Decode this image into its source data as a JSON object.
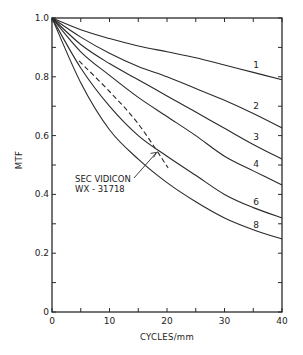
{
  "chart_data": {
    "type": "line",
    "title": "",
    "xlabel": "CYCLES/mm",
    "ylabel": "MTF",
    "xlim": [
      0,
      40
    ],
    "ylim": [
      0,
      1.0
    ],
    "grid": false,
    "x_ticks": [
      0,
      10,
      20,
      30,
      40
    ],
    "x_tick_labels": [
      "0",
      "10",
      "20",
      "30",
      "40"
    ],
    "x_minor_ticks": [
      5,
      15,
      25,
      35
    ],
    "y_ticks": [
      0,
      0.2,
      0.4,
      0.6,
      0.8,
      1.0
    ],
    "y_tick_labels": [
      "0",
      "0.2",
      "0.4",
      "0.6",
      "0.8",
      "1.0"
    ],
    "y_minor_ticks": [
      0.1,
      0.3,
      0.5,
      0.7,
      0.9
    ],
    "x": [
      0,
      5,
      10,
      15,
      20,
      25,
      30,
      35,
      40
    ],
    "series": [
      {
        "name": "1",
        "style": "solid",
        "values": [
          1.0,
          0.96,
          0.93,
          0.905,
          0.885,
          0.865,
          0.84,
          0.815,
          0.79
        ]
      },
      {
        "name": "2",
        "style": "solid",
        "values": [
          1.0,
          0.935,
          0.88,
          0.835,
          0.8,
          0.76,
          0.72,
          0.675,
          0.626
        ]
      },
      {
        "name": "3",
        "style": "solid",
        "values": [
          1.0,
          0.91,
          0.845,
          0.79,
          0.735,
          0.68,
          0.625,
          0.57,
          0.52
        ]
      },
      {
        "name": "4",
        "style": "solid",
        "values": [
          1.0,
          0.885,
          0.805,
          0.73,
          0.665,
          0.6,
          0.53,
          0.48,
          0.432
        ]
      },
      {
        "name": "6",
        "style": "solid",
        "values": [
          1.0,
          0.83,
          0.7,
          0.6,
          0.53,
          0.465,
          0.4,
          0.355,
          0.32
        ]
      },
      {
        "name": "8",
        "style": "solid",
        "values": [
          1.0,
          0.78,
          0.62,
          0.52,
          0.44,
          0.375,
          0.32,
          0.28,
          0.248
        ]
      },
      {
        "name": "SEC VIDICON WX-31718",
        "style": "dashed",
        "x": [
          4.7,
          10,
          15,
          20.2
        ],
        "values": [
          0.854,
          0.75,
          0.64,
          0.49
        ]
      }
    ],
    "curve_labels": [
      {
        "text": "1",
        "x": 35.5,
        "y": 0.84
      },
      {
        "text": "2",
        "x": 35.5,
        "y": 0.7
      },
      {
        "text": "3",
        "x": 35.5,
        "y": 0.595
      },
      {
        "text": "4",
        "x": 35.5,
        "y": 0.505
      },
      {
        "text": "6",
        "x": 35.5,
        "y": 0.375
      },
      {
        "text": "8",
        "x": 35.5,
        "y": 0.295
      }
    ],
    "annotations": [
      {
        "text": "SEC VIDICON",
        "line2": "WX - 31718",
        "x": 4,
        "y": 0.455,
        "arrow_to": [
          18.2,
          0.543
        ]
      }
    ]
  },
  "labels": {
    "xlabel": "CYCLES/mm",
    "ylabel": "MTF",
    "annotation_line1": "SEC VIDICON",
    "annotation_line2": "WX - 31718"
  }
}
